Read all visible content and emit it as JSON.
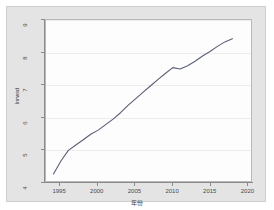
{
  "chart_data": {
    "type": "line",
    "title": "",
    "xlabel": "年份",
    "ylabel": "lnrwsd",
    "xlim": [
      1993.0,
      2020.5
    ],
    "ylim": [
      4.0,
      9.0
    ],
    "grid": true,
    "legend": "none",
    "xticks": [
      "1995",
      "2000",
      "2005",
      "2010",
      "2015",
      "2020"
    ],
    "xtick_values": [
      1995,
      2000,
      2005,
      2010,
      2015,
      2020
    ],
    "yticks": [
      "4",
      "5",
      "6",
      "7",
      "8",
      "9"
    ],
    "ytick_values": [
      4,
      5,
      6,
      7,
      8,
      9
    ],
    "series": [
      {
        "name": "lnrwsd",
        "color": "#5a5f73",
        "x": [
          1994,
          1995,
          1996,
          1997,
          1998,
          1999,
          2000,
          2001,
          2002,
          2003,
          2004,
          2005,
          2006,
          2007,
          2008,
          2009,
          2010,
          2011,
          2012,
          2013,
          2014,
          2015,
          2016,
          2017,
          2018
        ],
        "values": [
          4.22,
          4.62,
          4.95,
          5.12,
          5.28,
          5.45,
          5.58,
          5.75,
          5.92,
          6.12,
          6.35,
          6.55,
          6.75,
          6.95,
          7.15,
          7.34,
          7.52,
          7.48,
          7.58,
          7.72,
          7.88,
          8.02,
          8.18,
          8.32,
          8.42
        ]
      }
    ],
    "annotations": []
  },
  "axis": {
    "y_label": "lnrwsd",
    "x_label": "年份",
    "x_tick_labels": [
      "1995",
      "2000",
      "2005",
      "2010",
      "2015",
      "2020"
    ],
    "y_tick_labels": [
      "9",
      "8",
      "7",
      "6",
      "5",
      "4"
    ]
  },
  "colors": {
    "graph_region_bg": "#e4e4e4",
    "plot_bg": "#fdfdfd",
    "line": "#5a5f73",
    "axis": "#8a8a8a",
    "grid": "#ececec",
    "tick_text": "#4a4a4a"
  }
}
